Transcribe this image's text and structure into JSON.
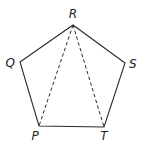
{
  "diagram": {
    "vertices": [
      {
        "name": "R",
        "x": 73,
        "y": 25,
        "label_x": 73,
        "label_y": 18,
        "anchor": "middle"
      },
      {
        "name": "S",
        "x": 125,
        "y": 63,
        "label_x": 129,
        "label_y": 68,
        "anchor": "start"
      },
      {
        "name": "T",
        "x": 104,
        "y": 127,
        "label_x": 104,
        "label_y": 140,
        "anchor": "middle"
      },
      {
        "name": "P",
        "x": 39,
        "y": 126,
        "label_x": 35,
        "label_y": 140,
        "anchor": "middle"
      },
      {
        "name": "Q",
        "x": 20,
        "y": 62,
        "label_x": 15,
        "label_y": 67,
        "anchor": "end"
      }
    ],
    "edges": [
      [
        "R",
        "S"
      ],
      [
        "S",
        "T"
      ],
      [
        "T",
        "P"
      ],
      [
        "P",
        "Q"
      ],
      [
        "Q",
        "R"
      ]
    ],
    "dashed_diagonals": [
      [
        "R",
        "P"
      ],
      [
        "R",
        "T"
      ]
    ],
    "colors": {
      "stroke": "#2a2a2a",
      "label": "#222222",
      "background": "#ffffff"
    }
  }
}
